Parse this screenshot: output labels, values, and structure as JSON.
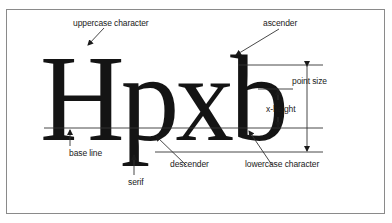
{
  "diagram": {
    "sample_text": "Hpxb",
    "labels": {
      "uppercase": "uppercase character",
      "ascender": "ascender",
      "point_size": "point size",
      "x_height": "x-height",
      "base_line": "base line",
      "serif": "serif",
      "descender": "descender",
      "lowercase": "lowercase character"
    },
    "colors": {
      "ink": "#141414",
      "lines": "#333333",
      "frame": "#8a8a8a",
      "background": "#ffffff"
    }
  }
}
